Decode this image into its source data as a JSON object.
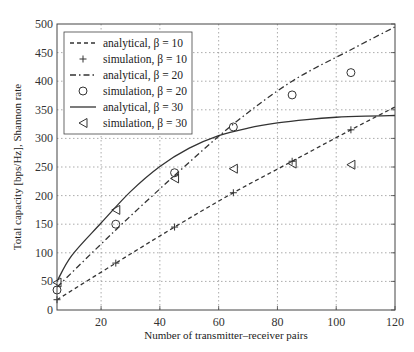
{
  "chart_data": {
    "type": "line",
    "title": "",
    "xlabel": "Number of transmitter–receiver pairs",
    "ylabel": "Total capacity [bps/Hz], Shannon rate",
    "xlim": [
      5,
      120
    ],
    "ylim": [
      0,
      500
    ],
    "xticks": [
      20,
      40,
      60,
      80,
      100,
      120
    ],
    "yticks": [
      0,
      50,
      100,
      150,
      200,
      250,
      300,
      350,
      400,
      450,
      500
    ],
    "grid": true,
    "legend_position": "top-left",
    "series": [
      {
        "name": "analytical, β = 10",
        "kind": "line",
        "style": "dashed",
        "x": [
          5,
          25,
          45,
          65,
          85,
          105,
          120
        ],
        "y": [
          18,
          82,
          145,
          205,
          260,
          315,
          355
        ]
      },
      {
        "name": "simulation, β = 10",
        "kind": "marker",
        "marker": "plus",
        "x": [
          5,
          25,
          45,
          65,
          85,
          105
        ],
        "y": [
          18,
          82,
          145,
          205,
          260,
          315
        ]
      },
      {
        "name": "analytical, β = 20",
        "kind": "line",
        "style": "dashdot",
        "x": [
          5,
          25,
          45,
          65,
          85,
          105,
          120
        ],
        "y": [
          40,
          140,
          235,
          325,
          400,
          455,
          495
        ]
      },
      {
        "name": "simulation, β = 20",
        "kind": "marker",
        "marker": "circle",
        "x": [
          5,
          25,
          45,
          65,
          85,
          105
        ],
        "y": [
          35,
          150,
          240,
          320,
          376,
          415
        ]
      },
      {
        "name": "analytical, β = 30",
        "kind": "line",
        "style": "solid",
        "x": [
          5,
          10,
          20,
          30,
          40,
          50,
          60,
          70,
          80,
          90,
          100,
          110,
          120
        ],
        "y": [
          50,
          95,
          152,
          207,
          251,
          283,
          305,
          318,
          327,
          333,
          337,
          339,
          340
        ]
      },
      {
        "name": "simulation, β = 30",
        "kind": "marker",
        "marker": "triangle-left",
        "x": [
          5,
          25,
          45,
          65,
          85,
          105
        ],
        "y": [
          48,
          175,
          230,
          247,
          256,
          254
        ]
      }
    ]
  }
}
